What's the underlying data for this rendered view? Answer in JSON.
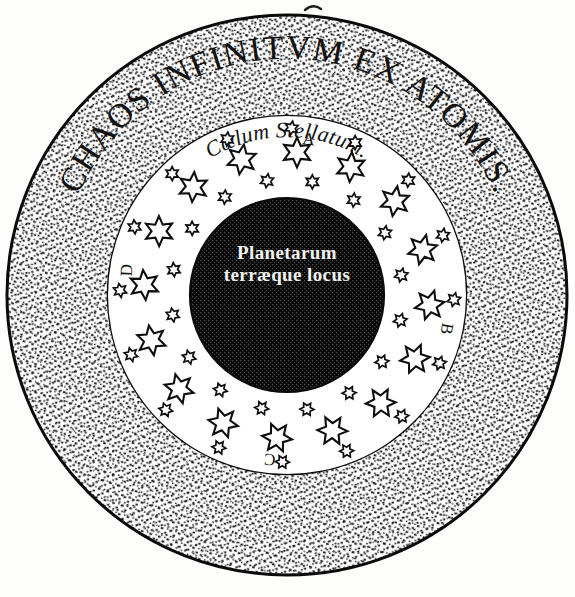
{
  "figure": {
    "background_color": "#fdfdfb",
    "ink_color": "#0d0d0d"
  },
  "rings": {
    "outer": {
      "name": "chaos-ring",
      "inscription": "CHAOS INFINITVM EX ATOMIS.",
      "texture": "stipple",
      "center_x": 287,
      "center_y": 295,
      "outer_radius": 280,
      "inner_radius": 179,
      "text_radius": 228
    },
    "middle": {
      "name": "stellar-ring",
      "inscription": "Cœlum Stellatum.",
      "texture": "plain-white",
      "center_x": 287,
      "center_y": 295,
      "outer_radius": 179,
      "inner_radius": 97,
      "text_radius": 149
    },
    "inner": {
      "name": "planetary-disk",
      "texture": "mezzotint-dark",
      "center_x": 287,
      "center_y": 295,
      "radius": 97,
      "fill_color": "#0b0b0b",
      "lines": [
        "Planetarum",
        "terræque locus"
      ]
    }
  },
  "markers": [
    {
      "id": "A",
      "label": "A",
      "position": "top",
      "angle_deg": -82,
      "radius": 152,
      "rotation_deg": 8
    },
    {
      "id": "B",
      "label": "B",
      "position": "right",
      "angle_deg": 12,
      "radius": 158,
      "rotation_deg": 100
    },
    {
      "id": "C",
      "label": "C",
      "position": "bottom",
      "angle_deg": 96,
      "radius": 160,
      "rotation_deg": 186
    },
    {
      "id": "D",
      "label": "D",
      "position": "left",
      "angle_deg": 189,
      "radius": 157,
      "rotation_deg": 272
    }
  ],
  "stars": {
    "large_count": 16,
    "small_count": 32,
    "large_radius": 143,
    "small_inner_radius": 116,
    "small_outer_radius": 167,
    "large_size": 15,
    "small_size": 7,
    "points": 6,
    "fill_color": "#ffffff",
    "outline_color": "#0d0d0d"
  },
  "artifact": {
    "name": "page-edge-mark",
    "description": "faint ink mark at top page edge",
    "x": 312,
    "y": 6
  }
}
